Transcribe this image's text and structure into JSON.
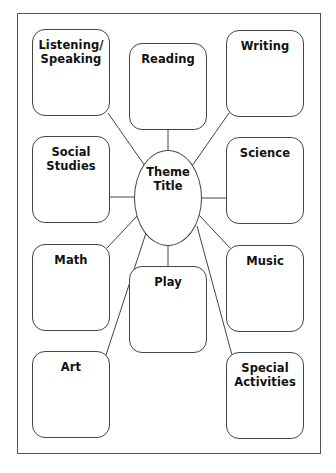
{
  "diagram": {
    "type": "theme web",
    "center": {
      "label": "Theme\nTitle"
    },
    "boxes": [
      {
        "id": "listening-speaking",
        "label": "Listening/\nSpeaking"
      },
      {
        "id": "reading",
        "label": "Reading"
      },
      {
        "id": "writing",
        "label": "Writing"
      },
      {
        "id": "social-studies",
        "label": "Social\nStudies"
      },
      {
        "id": "science",
        "label": "Science"
      },
      {
        "id": "math",
        "label": "Math"
      },
      {
        "id": "play",
        "label": "Play"
      },
      {
        "id": "music",
        "label": "Music"
      },
      {
        "id": "art",
        "label": "Art"
      },
      {
        "id": "special-activities",
        "label": "Special\nActivities"
      }
    ]
  },
  "colors": {
    "line": "#444444",
    "text": "#111111",
    "background": "#ffffff"
  }
}
